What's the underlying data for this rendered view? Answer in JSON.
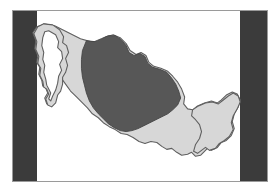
{
  "figure": {
    "kind": "map-illustration",
    "background_color": "#ffffff",
    "frame": {
      "border_color": "#9a9a9a",
      "fill_color": "#ffffff"
    },
    "bands": {
      "color": "#3b3b3b",
      "left_label": "left-letterbox-band",
      "right_label": "right-letterbox-band"
    },
    "legend": {
      "land_color": "#d7d7d7",
      "land_outline_color": "#5f5f5f",
      "highlight_color": "#575757",
      "highlight_outline_color": "#444444"
    },
    "regions": [
      {
        "name": "mexico-landmass",
        "role": "base",
        "color": "#d7d7d7"
      },
      {
        "name": "north-central-highlight",
        "role": "highlight",
        "color": "#575757"
      }
    ]
  }
}
